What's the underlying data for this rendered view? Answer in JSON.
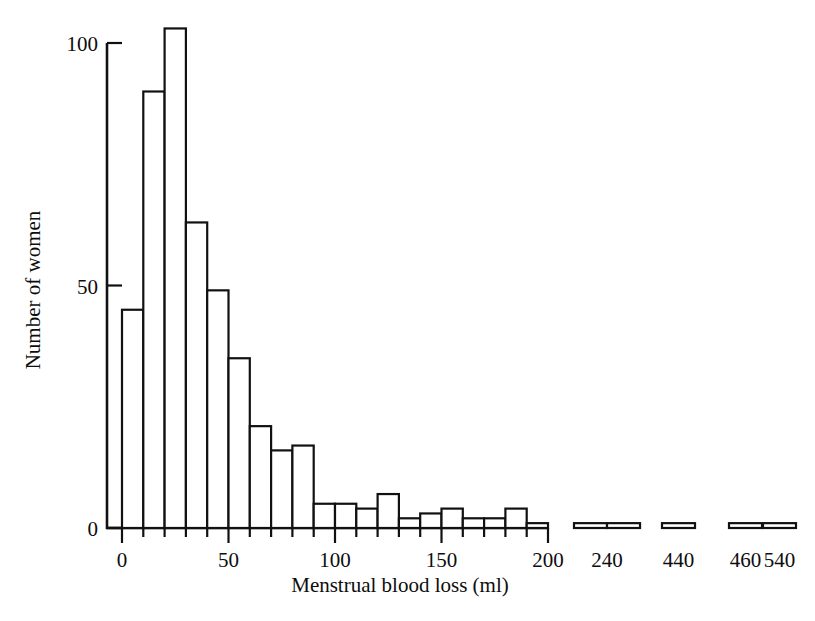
{
  "chart_data": {
    "type": "bar",
    "title": "",
    "subtitle": "",
    "xlabel": "Menstrual blood loss (ml)",
    "ylabel": "Number of women",
    "grid": false,
    "legend": "none",
    "xlim": [
      0,
      200
    ],
    "ylim": [
      0,
      105
    ],
    "y_ticks": [
      0,
      50,
      100
    ],
    "y_tick_labels": [
      "0",
      "50",
      "100"
    ],
    "x_major_ticks": [
      0,
      50,
      100,
      150,
      200
    ],
    "x_major_tick_labels": [
      "0",
      "50",
      "100",
      "150",
      "200"
    ],
    "x_minor_tick_step": 10,
    "bin_width": 10,
    "axis_break_note": "x-axis is broken after 200; outlier bins plotted at 240, 440, 460, 540",
    "bins": [
      {
        "bin_start": 0,
        "bin_end": 10,
        "value": 45
      },
      {
        "bin_start": 10,
        "bin_end": 20,
        "value": 90
      },
      {
        "bin_start": 20,
        "bin_end": 30,
        "value": 103
      },
      {
        "bin_start": 30,
        "bin_end": 40,
        "value": 63
      },
      {
        "bin_start": 40,
        "bin_end": 50,
        "value": 49
      },
      {
        "bin_start": 50,
        "bin_end": 60,
        "value": 35
      },
      {
        "bin_start": 60,
        "bin_end": 70,
        "value": 21
      },
      {
        "bin_start": 70,
        "bin_end": 80,
        "value": 16
      },
      {
        "bin_start": 80,
        "bin_end": 90,
        "value": 17
      },
      {
        "bin_start": 90,
        "bin_end": 100,
        "value": 5
      },
      {
        "bin_start": 100,
        "bin_end": 110,
        "value": 5
      },
      {
        "bin_start": 110,
        "bin_end": 120,
        "value": 4
      },
      {
        "bin_start": 120,
        "bin_end": 130,
        "value": 7
      },
      {
        "bin_start": 130,
        "bin_end": 140,
        "value": 2
      },
      {
        "bin_start": 140,
        "bin_end": 150,
        "value": 3
      },
      {
        "bin_start": 150,
        "bin_end": 160,
        "value": 4
      },
      {
        "bin_start": 160,
        "bin_end": 170,
        "value": 2
      },
      {
        "bin_start": 170,
        "bin_end": 180,
        "value": 2
      },
      {
        "bin_start": 180,
        "bin_end": 190,
        "value": 4
      },
      {
        "bin_start": 190,
        "bin_end": 200,
        "value": 1
      }
    ],
    "outlier_bins": [
      {
        "label": "240",
        "value": 1,
        "width_units": 10
      },
      {
        "label": "240b",
        "value": 1,
        "width_units": 10
      },
      {
        "label": "440",
        "value": 1,
        "width_units": 10
      },
      {
        "label": "460",
        "value": 1,
        "width_units": 10
      },
      {
        "label": "540",
        "value": 1,
        "width_units": 10
      }
    ],
    "outlier_tick_labels": [
      "240",
      "440",
      "460",
      "540"
    ]
  },
  "figure": {
    "background_color": "#ffffff",
    "line_color": "#111111",
    "text_color": "#0d0d0d"
  }
}
